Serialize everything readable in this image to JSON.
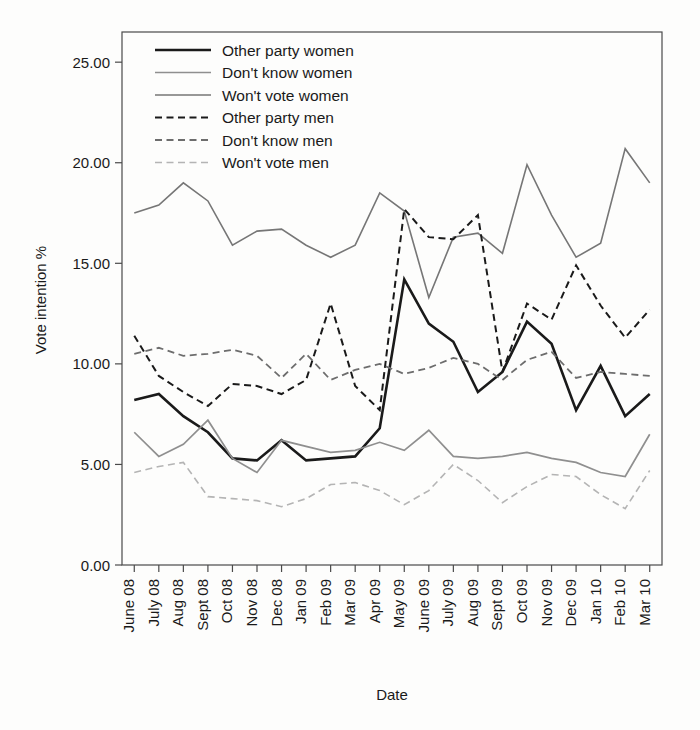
{
  "chart_data": {
    "type": "line",
    "title": "",
    "xlabel": "Date",
    "ylabel": "Vote intention %",
    "ylim": [
      0,
      26.5
    ],
    "yticks": [
      0,
      5,
      10,
      15,
      20,
      25
    ],
    "ytick_labels": [
      "0.00",
      "5.00",
      "10.00",
      "15.00",
      "20.00",
      "25.00"
    ],
    "grid": false,
    "legend_position": "top-left-inside",
    "categories": [
      "June 08",
      "July 08",
      "Aug 08",
      "Sept 08",
      "Oct 08",
      "Nov 08",
      "Dec 08",
      "Jan 09",
      "Feb 09",
      "Mar 09",
      "Apr 09",
      "May 09",
      "June 09",
      "July 09",
      "Aug 09",
      "Sept 09",
      "Oct 09",
      "Nov 09",
      "Dec 09",
      "Jan 10",
      "Feb 10",
      "Mar 10"
    ],
    "series": [
      {
        "name": "Other party women",
        "style": "solid",
        "color": "#1a1a1a",
        "width": 2.6,
        "values": [
          8.2,
          8.5,
          7.4,
          6.6,
          5.3,
          5.2,
          6.2,
          5.2,
          5.3,
          5.4,
          6.8,
          14.2,
          12.0,
          11.1,
          8.6,
          9.6,
          12.1,
          11.0,
          7.7,
          9.9,
          7.4,
          8.5
        ]
      },
      {
        "name": "Don't know women",
        "style": "solid",
        "color": "#8f8f8f",
        "width": 1.7,
        "values": [
          6.6,
          5.4,
          6.0,
          7.2,
          5.3,
          4.6,
          6.2,
          5.9,
          5.6,
          5.7,
          6.1,
          5.7,
          6.7,
          5.4,
          5.3,
          5.4,
          5.6,
          5.3,
          5.1,
          4.6,
          4.4,
          6.5
        ]
      },
      {
        "name": "Won't vote women",
        "style": "solid",
        "color": "#767676",
        "width": 1.6,
        "values": [
          17.5,
          17.9,
          19.0,
          18.1,
          15.9,
          16.6,
          16.7,
          15.9,
          15.3,
          15.9,
          18.5,
          17.6,
          13.3,
          16.3,
          16.5,
          15.5,
          19.9,
          17.4,
          15.3,
          16.0,
          20.7,
          19.0
        ]
      },
      {
        "name": "Other party men",
        "style": "dashed",
        "color": "#1a1a1a",
        "width": 2.0,
        "values": [
          11.4,
          9.4,
          8.6,
          7.9,
          9.0,
          8.9,
          8.5,
          9.2,
          13.0,
          8.9,
          7.7,
          17.7,
          16.3,
          16.2,
          17.4,
          9.6,
          13.0,
          12.2,
          14.9,
          12.9,
          11.3,
          12.7
        ]
      },
      {
        "name": "Don't know men",
        "style": "dashed",
        "color": "#6d6d6d",
        "width": 1.8,
        "values": [
          10.5,
          10.8,
          10.4,
          10.5,
          10.7,
          10.4,
          9.3,
          10.5,
          9.2,
          9.7,
          10.0,
          9.5,
          9.8,
          10.3,
          10.0,
          9.2,
          10.2,
          10.6,
          9.3,
          9.6,
          9.5,
          9.4
        ]
      },
      {
        "name": "Won't vote men",
        "style": "dashed",
        "color": "#b4b4b4",
        "width": 1.6,
        "values": [
          4.6,
          4.9,
          5.1,
          3.4,
          3.3,
          3.2,
          2.9,
          3.3,
          4.0,
          4.1,
          3.7,
          3.0,
          3.7,
          5.0,
          4.2,
          3.1,
          3.9,
          4.5,
          4.4,
          3.5,
          2.8,
          4.7
        ]
      }
    ]
  },
  "legend": {
    "items": [
      {
        "label": "Other party women"
      },
      {
        "label": "Don't know women"
      },
      {
        "label": "Won't vote women"
      },
      {
        "label": "Other party men"
      },
      {
        "label": "Don't know men"
      },
      {
        "label": "Won't vote men"
      }
    ]
  }
}
